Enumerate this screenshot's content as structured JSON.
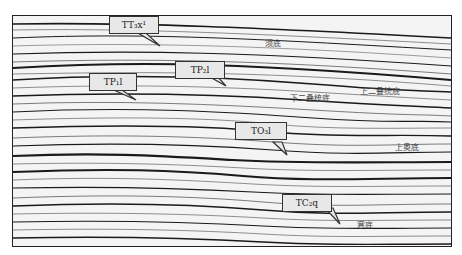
{
  "figure": {
    "type": "seismic-section",
    "callouts": [
      {
        "id": "TT3x1",
        "label": "TT₃x¹"
      },
      {
        "id": "TP1l",
        "label": "TP₁l"
      },
      {
        "id": "TP2l",
        "label": "TP₂l"
      },
      {
        "id": "TO3l",
        "label": "TO₃l"
      },
      {
        "id": "TC2q",
        "label": "TC₂q"
      }
    ],
    "horizons": [
      {
        "id": "xu-base",
        "label": "须底"
      },
      {
        "id": "upper-permian-base",
        "label": "上二叠统底"
      },
      {
        "id": "lower-permian-base",
        "label": "下二叠统底"
      },
      {
        "id": "upper-ordovician-base",
        "label": "上奥底"
      },
      {
        "id": "cambrian-base",
        "label": "寒底"
      }
    ],
    "colors": {
      "reflector": "#1a1a1a",
      "background": "#f4f4f4",
      "callout_fill": "#e8e8e8"
    }
  }
}
